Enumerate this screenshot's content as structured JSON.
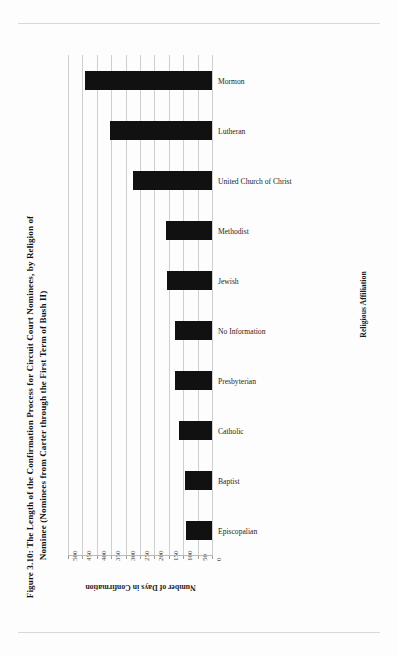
{
  "figure": {
    "title_line1": "Figure 3.10: The Length of the Confirmation Process for Circuit Court Nominees, by Religion of",
    "title_line2": "Nominee (Nominees from Carter through the First Term of Bush II)"
  },
  "chart_data": {
    "type": "bar",
    "orientation": "horizontal",
    "title": "Figure 3.10: The Length of the Confirmation Process for Circuit Court Nominees, by Religion of Nominee (Nominees from Carter through the First Term of Bush II)",
    "xlabel": "Number of Days in Confirmation",
    "ylabel": "Religious Affiliation",
    "xlim": [
      0,
      500
    ],
    "x_axis_reversed": true,
    "grid": true,
    "legend": "none",
    "bar_color": "#111111",
    "tick_labels": [
      "500",
      "450",
      "400",
      "350",
      "300",
      "250",
      "200",
      "150",
      "100",
      "50",
      "0"
    ],
    "tick_values": [
      500,
      450,
      400,
      350,
      300,
      250,
      200,
      150,
      100,
      50,
      0
    ],
    "categories": [
      "Mormon",
      "Lutheran",
      "United Church of Christ",
      "Methodist",
      "Jewish",
      "No Information",
      "Presbyterian",
      "Catholic",
      "Baptist",
      "Episcopalian"
    ],
    "values": [
      440,
      355,
      275,
      160,
      155,
      130,
      130,
      115,
      95,
      90
    ]
  }
}
